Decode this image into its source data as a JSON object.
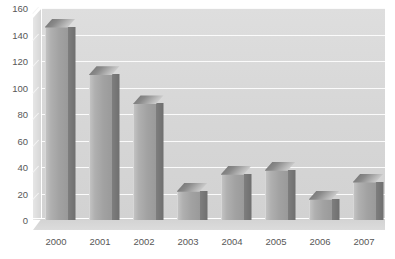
{
  "chart_data": {
    "type": "bar",
    "title": "",
    "xlabel": "",
    "ylabel": "",
    "categories": [
      "2000",
      "2001",
      "2002",
      "2003",
      "2004",
      "2005",
      "2006",
      "2007"
    ],
    "values": [
      146,
      110,
      88,
      22,
      35,
      38,
      16,
      29
    ],
    "ylim": [
      0,
      160
    ],
    "ytick_labels": [
      "0",
      "20",
      "40",
      "60",
      "80",
      "100",
      "120",
      "140",
      "160"
    ],
    "ytick_values": [
      0,
      20,
      40,
      60,
      80,
      100,
      120,
      140,
      160
    ],
    "grid": true,
    "legend": false,
    "style": "3d-columns-grayscale",
    "colors": {
      "bar_front": "#a8a8a8",
      "bar_side": "#767676",
      "bar_top": "#cccccc",
      "plot_background": "#d8d8d8",
      "gridline": "#fbfbfb",
      "tick_label": "#585858",
      "page_background": "#ffffff"
    }
  }
}
